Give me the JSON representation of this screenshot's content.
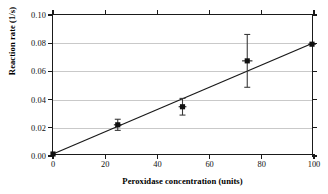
{
  "chart_data": {
    "type": "scatter",
    "title": "",
    "xlabel": "Peroxidase concentration (units)",
    "ylabel": "Reaction rate (1/s)",
    "xlim": [
      0,
      100
    ],
    "ylim": [
      0.0,
      0.1
    ],
    "grid": "horizontal",
    "legend": "none",
    "xticks": [
      {
        "value": 0,
        "label": "0"
      },
      {
        "value": 20,
        "label": "20"
      },
      {
        "value": 40,
        "label": "40"
      },
      {
        "value": 60,
        "label": "60"
      },
      {
        "value": 80,
        "label": "80"
      },
      {
        "value": 100,
        "label": "100"
      }
    ],
    "yticks": [
      {
        "value": 0.0,
        "label": "0.00"
      },
      {
        "value": 0.02,
        "label": "0.02"
      },
      {
        "value": 0.04,
        "label": "0.04"
      },
      {
        "value": 0.06,
        "label": "0.06"
      },
      {
        "value": 0.08,
        "label": "0.08"
      },
      {
        "value": 0.1,
        "label": "0.10"
      }
    ],
    "series": [
      {
        "name": "Reaction rate",
        "marker": "filled-square",
        "points": [
          {
            "x": 0,
            "y": 0.0,
            "yerr_low": 0.0,
            "yerr_high": 0.0,
            "xerr": 0
          },
          {
            "x": 25,
            "y": 0.021,
            "yerr_low": 0.017,
            "yerr_high": 0.025,
            "xerr": 1.5
          },
          {
            "x": 50,
            "y": 0.034,
            "yerr_low": 0.028,
            "yerr_high": 0.04,
            "xerr": 1.5
          },
          {
            "x": 75,
            "y": 0.067,
            "yerr_low": 0.048,
            "yerr_high": 0.086,
            "xerr": 2.0
          },
          {
            "x": 100,
            "y": 0.079,
            "yerr_low": 0.079,
            "yerr_high": 0.079,
            "xerr": 1.5
          }
        ]
      }
    ],
    "fit_line": {
      "name": "linear fit through origin",
      "x_start": 0,
      "y_start": 0.0,
      "x_end": 100,
      "y_end": 0.0795
    },
    "colors": {
      "axis": "#1a1a1a",
      "grid": "#c9c9c9",
      "marker": "#111111",
      "errorbar": "#3a3a3a",
      "fit_line": "#1a1a1a",
      "background": "#ffffff"
    }
  }
}
